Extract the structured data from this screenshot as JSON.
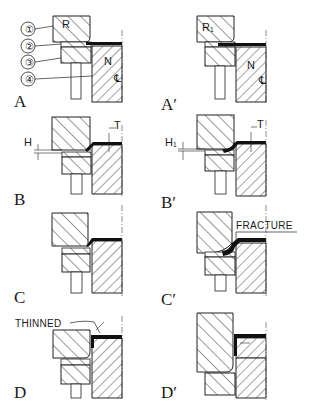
{
  "figure": {
    "panels": [
      {
        "id": "A",
        "label": "A",
        "tool_label": "R",
        "part_label": "N",
        "centerline_label": "℄"
      },
      {
        "id": "A'",
        "label": "A′",
        "tool_label": "R₁",
        "part_label": "N",
        "centerline_label": "℄"
      },
      {
        "id": "B",
        "label": "B",
        "dim_h": "H",
        "dim_t": "T"
      },
      {
        "id": "B'",
        "label": "B′",
        "dim_h": "H₁",
        "dim_t": "T"
      },
      {
        "id": "C",
        "label": "C"
      },
      {
        "id": "C'",
        "label": "C′",
        "callout": "FRACTURE"
      },
      {
        "id": "D",
        "label": "D",
        "callout": "THINNED"
      },
      {
        "id": "D'",
        "label": "D′"
      }
    ],
    "component_numbers": [
      "①",
      "②",
      "③",
      "④"
    ]
  }
}
